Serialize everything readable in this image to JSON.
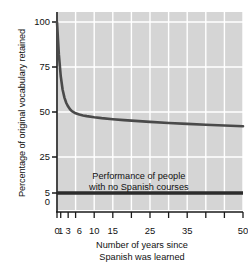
{
  "chart_data": {
    "type": "line",
    "title": "",
    "xlabel": "Number of years since Spanish was learned",
    "ylabel": "Percentage of original vocabulary retained",
    "xlim": [
      0,
      50
    ],
    "ylim": [
      0,
      105
    ],
    "grid": true,
    "legend": "none",
    "xticks": [
      0,
      1,
      3,
      6,
      10,
      15,
      25,
      35,
      50
    ],
    "xtick_labels": [
      "0",
      "1",
      "3",
      "6",
      "10",
      "15",
      "25",
      "35",
      "50"
    ],
    "xminor_ticks": [
      0,
      1,
      3,
      5,
      10,
      15,
      20,
      25,
      30,
      35,
      40,
      45,
      50
    ],
    "yticks": [
      0,
      5,
      25,
      50,
      75,
      100
    ],
    "ytick_labels": [
      "0",
      "5",
      "25",
      "50",
      "75",
      "100"
    ],
    "series": [
      {
        "name": "Vocabulary retained",
        "type": "line",
        "color": "#4a4a4a",
        "x": [
          0,
          0.5,
          1,
          1.5,
          2,
          2.5,
          3,
          3.5,
          4,
          5,
          6,
          7,
          8,
          10,
          12,
          15,
          18,
          20,
          25,
          30,
          35,
          40,
          45,
          50
        ],
        "values": [
          100,
          82,
          70,
          62.5,
          58,
          55,
          53,
          51.5,
          50.5,
          49.3,
          48.6,
          48.1,
          47.7,
          47.1,
          46.6,
          46.0,
          45.5,
          45.2,
          44.5,
          43.9,
          43.4,
          42.9,
          42.5,
          42.1
        ]
      },
      {
        "name": "Performance of people with no Spanish courses",
        "type": "hline",
        "color": "#2b2b2b",
        "values": [
          5
        ]
      }
    ],
    "annotations": [
      {
        "text_line1": "Performance of people",
        "text_line2": "with no Spanish courses",
        "x": 22,
        "y": 14
      }
    ],
    "colors": {
      "plot_background": "#d5d5d5",
      "gridline": "#ffffff",
      "curve": "#4a4a4a",
      "baseline": "#2b2b2b",
      "axis": "#1a1a1a",
      "page_background": "#ffffff"
    }
  },
  "axes": {
    "y_title": "Percentage of original vocabulary retained",
    "x_title_line1": "Number of years since",
    "x_title_line2": "Spanish was learned"
  }
}
